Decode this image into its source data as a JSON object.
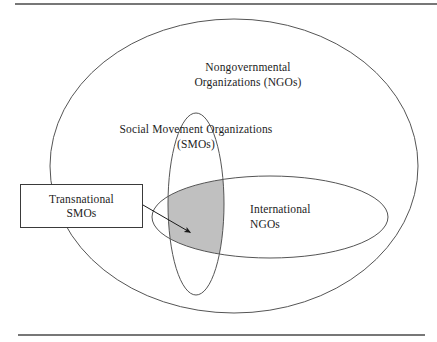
{
  "figure": {
    "type": "venn-diagram",
    "background_color": "#ffffff",
    "stroke_color": "#555555",
    "rule_color": "#4a4a4a",
    "shaded_region_color": "#c0c0c0"
  },
  "labels": {
    "outer_set": "Nongovernmental\nOrganizations (NGOs)",
    "vertical_set": "Social Movement Organizations\n(SMOs)",
    "horizontal_set": "International\nNGOs",
    "callout_box": "Transnational\nSMOs"
  },
  "shapes": {
    "outer_ellipse": {
      "name": "Nongovernmental Organizations (NGOs)",
      "cx": 234,
      "cy": 166,
      "rx": 184,
      "ry": 147
    },
    "vertical_ellipse": {
      "name": "Social Movement Organizations (SMOs)",
      "cx": 196,
      "cy": 204,
      "rx": 28,
      "ry": 91
    },
    "horizontal_ellipse": {
      "name": "International NGOs",
      "cx": 270,
      "cy": 217,
      "rx": 118,
      "ry": 41
    },
    "shaded_intersection": {
      "name": "Transnational SMOs",
      "description": "overlap of Social Movement Organizations and International NGOs"
    },
    "callout_box": {
      "x": 20,
      "y": 184,
      "width": 123,
      "height": 44
    },
    "arrow": {
      "from_x": 143,
      "from_y": 205,
      "to_x": 193,
      "to_y": 234
    }
  },
  "rules": {
    "top": {
      "x1": 15,
      "y1": 4,
      "x2": 437,
      "y2": 4
    },
    "bottom": {
      "x1": 18,
      "y1": 335,
      "x2": 425,
      "y2": 335
    }
  }
}
